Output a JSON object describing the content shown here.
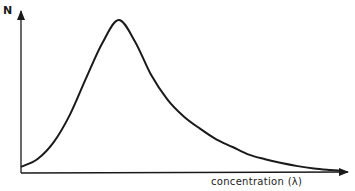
{
  "chart_data": {
    "type": "line",
    "title": "",
    "xlabel": "concentration (λ)",
    "ylabel": "N",
    "grid": false,
    "legend": null,
    "axis_ticks": false,
    "x": [
      0,
      0.05,
      0.1,
      0.15,
      0.2,
      0.25,
      0.3,
      0.35,
      0.4,
      0.45,
      0.5,
      0.55,
      0.6,
      0.65,
      0.7,
      0.75,
      0.8,
      0.85,
      0.9,
      0.95,
      0.98
    ],
    "values": [
      0.04,
      0.09,
      0.2,
      0.38,
      0.62,
      0.85,
      1.0,
      0.86,
      0.64,
      0.48,
      0.37,
      0.29,
      0.22,
      0.17,
      0.12,
      0.09,
      0.065,
      0.045,
      0.03,
      0.02,
      0.015
    ],
    "xlim": [
      0,
      1
    ],
    "ylim": [
      0,
      1.1
    ],
    "color": "#1a1a1a"
  }
}
